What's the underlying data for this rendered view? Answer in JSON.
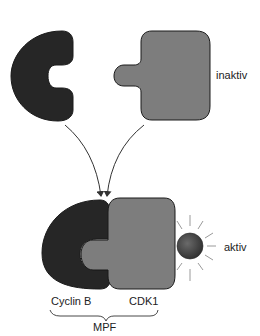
{
  "diagram": {
    "labels": {
      "inactive": "inaktiv",
      "active": "aktiv",
      "cyclin": "Cyclin B",
      "cdk": "CDK1",
      "complex": "MPF"
    },
    "colors": {
      "cyclin": "#262626",
      "cdk": "#7d7d7d",
      "outline": "#1a1a1a",
      "phosphate": "#4a4a4a",
      "rays": "#9a9a9a",
      "arrow": "#333333"
    },
    "nodes": [
      {
        "id": "cyclin-b-free",
        "shape": "c-shape",
        "state": "separate"
      },
      {
        "id": "cdk1-free",
        "shape": "puzzle-square",
        "state": "inaktiv"
      },
      {
        "id": "mpf-complex",
        "parts": [
          "Cyclin B",
          "CDK1",
          "phosphate"
        ],
        "state": "aktiv"
      }
    ],
    "edges": [
      {
        "from": "cyclin-b-free",
        "to": "mpf-complex"
      },
      {
        "from": "cdk1-free",
        "to": "mpf-complex"
      }
    ]
  }
}
